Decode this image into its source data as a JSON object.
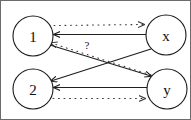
{
  "figure": {
    "type": "directed-graph",
    "width": 191,
    "height": 120,
    "border_color": "#6b6b6b",
    "background": "#ffffff"
  },
  "nodes": [
    {
      "id": "n1",
      "label": "1",
      "cx": 32,
      "cy": 35,
      "r": 20
    },
    {
      "id": "nx",
      "label": "x",
      "cx": 165,
      "cy": 34,
      "r": 20
    },
    {
      "id": "n2",
      "label": "2",
      "cx": 32,
      "cy": 88,
      "r": 20
    },
    {
      "id": "ny",
      "label": "y",
      "cx": 166,
      "cy": 88,
      "r": 20
    }
  ],
  "edges": [
    {
      "id": "e-1-to-x-dotted",
      "from": "1",
      "to": "x",
      "style": "dotted",
      "label": ""
    },
    {
      "id": "e-x-to-1-solid",
      "from": "x",
      "to": "1",
      "style": "solid",
      "label": ""
    },
    {
      "id": "e-y-to-1-dotted",
      "from": "y",
      "to": "1",
      "style": "dotted",
      "label": "?"
    },
    {
      "id": "e-x-to-2-solid",
      "from": "x",
      "to": "2",
      "style": "solid",
      "label": ""
    },
    {
      "id": "e-1-to-y-solid",
      "from": "1",
      "to": "y",
      "style": "solid",
      "label": ""
    },
    {
      "id": "e-y-to-2-solid",
      "from": "y",
      "to": "2",
      "style": "solid",
      "label": ""
    },
    {
      "id": "e-2-to-y-dotted",
      "from": "2",
      "to": "y",
      "style": "dotted",
      "label": ""
    }
  ],
  "labels": {
    "node_1": "1",
    "node_2": "2",
    "node_x": "x",
    "node_y": "y",
    "question_mark": "?"
  },
  "colors": {
    "stroke": "#1f1f1f",
    "dotted_stroke": "#3a3a3a",
    "node_fill": "#ffffff",
    "text": "#111111"
  }
}
